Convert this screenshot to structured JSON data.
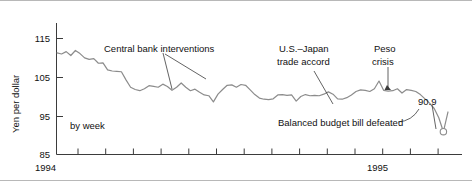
{
  "chart_data": {
    "type": "line",
    "title": "",
    "subtitle": "",
    "xlabel": "",
    "ylabel": "Yen per dollar",
    "note": "by week",
    "ylim": [
      85,
      119
    ],
    "yticks": [
      85,
      95,
      105,
      115
    ],
    "ytick_labels": [
      "85",
      "95",
      "105",
      "115"
    ],
    "xtick_labels": [
      "1994",
      "1995"
    ],
    "xlim": [
      0,
      78
    ],
    "grid": false,
    "legend": null,
    "x_tick_count": 15,
    "series": [
      {
        "name": "Yen per dollar (weekly)",
        "color": "#8c8c8c",
        "values": [
          111.3,
          111.0,
          111.6,
          110.6,
          111.9,
          111.1,
          110.0,
          109.6,
          109.8,
          108.6,
          108.7,
          106.9,
          106.6,
          106.5,
          106.4,
          104.3,
          102.4,
          101.8,
          101.5,
          102.0,
          102.8,
          102.6,
          102.4,
          103.2,
          102.6,
          101.6,
          102.4,
          103.5,
          102.4,
          101.5,
          101.9,
          101.1,
          100.4,
          100.2,
          98.6,
          100.6,
          101.8,
          102.9,
          103.0,
          102.4,
          103.1,
          102.9,
          101.7,
          100.5,
          99.6,
          99.3,
          99.2,
          99.4,
          100.4,
          100.5,
          100.3,
          100.4,
          98.8,
          100.0,
          100.5,
          100.2,
          100.3,
          100.2,
          100.6,
          101.2,
          100.6,
          99.4,
          99.3,
          99.7,
          100.4,
          101.3,
          101.7,
          101.6,
          101.3,
          102.0,
          104.0,
          101.6,
          101.4,
          101.5,
          102.0,
          100.9,
          101.8,
          101.6,
          101.3,
          100.5,
          99.4,
          98.3,
          96.9,
          94.5,
          90.9,
          96.0
        ]
      }
    ],
    "markers": [
      {
        "name": "low-point-marker",
        "label": "90.9",
        "value": 90.9,
        "style": "open-circle"
      }
    ],
    "annotations": [
      {
        "name": "central-bank-interventions",
        "text": "Central bank interventions"
      },
      {
        "name": "us-japan-trade-accord",
        "text_line1": "U.S.–Japan",
        "text_line2": "trade accord"
      },
      {
        "name": "peso-crisis",
        "text_line1": "Peso",
        "text_line2": "crisis"
      },
      {
        "name": "balanced-budget-bill",
        "text": "Balanced budget bill defeated"
      }
    ],
    "colors": {
      "line": "#8c8c8c",
      "axis": "#3b3b3b",
      "text": "#111111",
      "background": "#ffffff",
      "frame": "#b8b8b8"
    }
  }
}
